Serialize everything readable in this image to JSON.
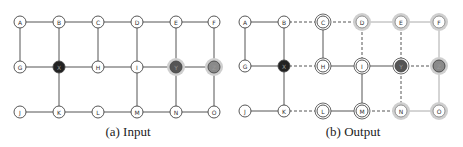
{
  "panels": [
    {
      "id": "a",
      "caption": "(a) Input",
      "caption_x": 53,
      "nodes": [
        {
          "id": "A",
          "label": "A",
          "x": 20,
          "y": 22,
          "style": "plain"
        },
        {
          "id": "B",
          "label": "B",
          "x": 59,
          "y": 22,
          "style": "plain"
        },
        {
          "id": "C",
          "label": "C",
          "x": 98,
          "y": 22,
          "style": "plain"
        },
        {
          "id": "D",
          "label": "D",
          "x": 137,
          "y": 22,
          "style": "plain"
        },
        {
          "id": "E",
          "label": "E",
          "x": 176,
          "y": 22,
          "style": "plain"
        },
        {
          "id": "F",
          "label": "F",
          "x": 214,
          "y": 22,
          "style": "plain"
        },
        {
          "id": "G",
          "label": "G",
          "x": 20,
          "y": 67,
          "style": "plain"
        },
        {
          "id": "X",
          "label": "X",
          "x": 59,
          "y": 67,
          "style": "black"
        },
        {
          "id": "H",
          "label": "H",
          "x": 98,
          "y": 67,
          "style": "plain"
        },
        {
          "id": "I",
          "label": "I",
          "x": 137,
          "y": 67,
          "style": "plain"
        },
        {
          "id": "Y",
          "label": "Y",
          "x": 176,
          "y": 67,
          "style": "darkgray-halo"
        },
        {
          "id": "Z",
          "label": "Z",
          "x": 214,
          "y": 67,
          "style": "gray-halo"
        },
        {
          "id": "J",
          "label": "J",
          "x": 20,
          "y": 112,
          "style": "plain"
        },
        {
          "id": "K",
          "label": "K",
          "x": 59,
          "y": 112,
          "style": "plain"
        },
        {
          "id": "L",
          "label": "L",
          "x": 98,
          "y": 112,
          "style": "plain"
        },
        {
          "id": "M",
          "label": "M",
          "x": 137,
          "y": 112,
          "style": "plain"
        },
        {
          "id": "N",
          "label": "N",
          "x": 176,
          "y": 112,
          "style": "plain"
        },
        {
          "id": "O",
          "label": "O",
          "x": 214,
          "y": 112,
          "style": "plain"
        }
      ],
      "edges": [
        {
          "from": "A",
          "to": "B",
          "style": "solid"
        },
        {
          "from": "B",
          "to": "C",
          "style": "solid"
        },
        {
          "from": "C",
          "to": "D",
          "style": "solid"
        },
        {
          "from": "D",
          "to": "E",
          "style": "solid"
        },
        {
          "from": "E",
          "to": "F",
          "style": "solid"
        },
        {
          "from": "A",
          "to": "G",
          "style": "solid"
        },
        {
          "from": "B",
          "to": "X",
          "style": "solid"
        },
        {
          "from": "C",
          "to": "H",
          "style": "solid"
        },
        {
          "from": "D",
          "to": "I",
          "style": "solid"
        },
        {
          "from": "E",
          "to": "Y",
          "style": "solid"
        },
        {
          "from": "F",
          "to": "Z",
          "style": "solid"
        },
        {
          "from": "G",
          "to": "X",
          "style": "solid"
        },
        {
          "from": "X",
          "to": "H",
          "style": "solid"
        },
        {
          "from": "H",
          "to": "I",
          "style": "solid"
        },
        {
          "from": "I",
          "to": "Y",
          "style": "solid"
        },
        {
          "from": "Y",
          "to": "Z",
          "style": "solid"
        },
        {
          "from": "X",
          "to": "K",
          "style": "solid"
        },
        {
          "from": "I",
          "to": "M",
          "style": "solid"
        },
        {
          "from": "Y",
          "to": "N",
          "style": "solid"
        },
        {
          "from": "Z",
          "to": "O",
          "style": "solid"
        },
        {
          "from": "J",
          "to": "K",
          "style": "solid"
        },
        {
          "from": "K",
          "to": "L",
          "style": "solid"
        },
        {
          "from": "L",
          "to": "M",
          "style": "solid"
        },
        {
          "from": "M",
          "to": "N",
          "style": "solid"
        },
        {
          "from": "N",
          "to": "O",
          "style": "solid"
        }
      ]
    },
    {
      "id": "b",
      "caption": "(b) Output",
      "caption_x": 278,
      "nodes": [
        {
          "id": "A",
          "label": "A",
          "x": 245,
          "y": 22,
          "style": "plain"
        },
        {
          "id": "B",
          "label": "B",
          "x": 284,
          "y": 22,
          "style": "plain"
        },
        {
          "id": "C",
          "label": "C",
          "x": 323,
          "y": 22,
          "style": "double"
        },
        {
          "id": "D",
          "label": "D",
          "x": 362,
          "y": 22,
          "style": "halo"
        },
        {
          "id": "E",
          "label": "E",
          "x": 401,
          "y": 22,
          "style": "halo"
        },
        {
          "id": "F",
          "label": "F",
          "x": 439,
          "y": 22,
          "style": "halo"
        },
        {
          "id": "G",
          "label": "G",
          "x": 245,
          "y": 66,
          "style": "plain"
        },
        {
          "id": "X",
          "label": "X",
          "x": 284,
          "y": 66,
          "style": "black"
        },
        {
          "id": "H",
          "label": "H",
          "x": 323,
          "y": 66,
          "style": "double"
        },
        {
          "id": "I",
          "label": "I",
          "x": 362,
          "y": 66,
          "style": "double"
        },
        {
          "id": "Y",
          "label": "Y",
          "x": 401,
          "y": 66,
          "style": "darkgray-double"
        },
        {
          "id": "Z",
          "label": "Z",
          "x": 439,
          "y": 66,
          "style": "gray-halo"
        },
        {
          "id": "J",
          "label": "J",
          "x": 245,
          "y": 111,
          "style": "plain"
        },
        {
          "id": "K",
          "label": "K",
          "x": 284,
          "y": 111,
          "style": "plain"
        },
        {
          "id": "L",
          "label": "L",
          "x": 323,
          "y": 111,
          "style": "double"
        },
        {
          "id": "M",
          "label": "M",
          "x": 362,
          "y": 111,
          "style": "double"
        },
        {
          "id": "N",
          "label": "N",
          "x": 401,
          "y": 111,
          "style": "halo"
        },
        {
          "id": "O",
          "label": "O",
          "x": 439,
          "y": 111,
          "style": "halo"
        }
      ],
      "edges": [
        {
          "from": "A",
          "to": "B",
          "style": "solid"
        },
        {
          "from": "B",
          "to": "C",
          "style": "dashed"
        },
        {
          "from": "C",
          "to": "D",
          "style": "dashed"
        },
        {
          "from": "D",
          "to": "E",
          "style": "light"
        },
        {
          "from": "E",
          "to": "F",
          "style": "light"
        },
        {
          "from": "A",
          "to": "G",
          "style": "solid"
        },
        {
          "from": "B",
          "to": "X",
          "style": "solid"
        },
        {
          "from": "C",
          "to": "H",
          "style": "solid"
        },
        {
          "from": "D",
          "to": "I",
          "style": "dashed"
        },
        {
          "from": "E",
          "to": "Y",
          "style": "dashed"
        },
        {
          "from": "F",
          "to": "Z",
          "style": "light"
        },
        {
          "from": "G",
          "to": "X",
          "style": "solid"
        },
        {
          "from": "X",
          "to": "H",
          "style": "dashed"
        },
        {
          "from": "H",
          "to": "I",
          "style": "solid"
        },
        {
          "from": "I",
          "to": "Y",
          "style": "solid"
        },
        {
          "from": "Y",
          "to": "Z",
          "style": "dashed"
        },
        {
          "from": "X",
          "to": "K",
          "style": "solid"
        },
        {
          "from": "I",
          "to": "M",
          "style": "solid"
        },
        {
          "from": "Y",
          "to": "N",
          "style": "dashed"
        },
        {
          "from": "Z",
          "to": "O",
          "style": "light"
        },
        {
          "from": "J",
          "to": "K",
          "style": "solid"
        },
        {
          "from": "K",
          "to": "L",
          "style": "dashed"
        },
        {
          "from": "L",
          "to": "M",
          "style": "solid"
        },
        {
          "from": "M",
          "to": "N",
          "style": "dashed"
        },
        {
          "from": "N",
          "to": "O",
          "style": "light"
        }
      ]
    }
  ],
  "colors": {
    "edge": "#555555",
    "edge_light": "#aaaaaa",
    "node_stroke": "#444444",
    "node_fill": "#ffffff",
    "black_fill": "#222222",
    "darkgray_fill": "#555555",
    "gray_fill": "#8a8a8a",
    "halo": "#cfcfcf"
  }
}
